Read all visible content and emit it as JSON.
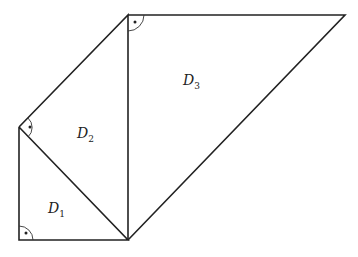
{
  "diagram": {
    "labels": {
      "d1": {
        "main": "D",
        "sub": "1"
      },
      "d2": {
        "main": "D",
        "sub": "2"
      },
      "d3": {
        "main": "D",
        "sub": "3"
      }
    },
    "vertices": {
      "A_bottom_left": [
        19,
        240
      ],
      "B_left_top": [
        19,
        127
      ],
      "C_bottom_mid": [
        128,
        240
      ],
      "E_top_mid": [
        128,
        15
      ],
      "F_top_right": [
        345,
        15
      ]
    },
    "right_angles": [
      "A_bottom_left",
      "B_left_top",
      "E_top_mid"
    ],
    "line_color": "#222222"
  }
}
